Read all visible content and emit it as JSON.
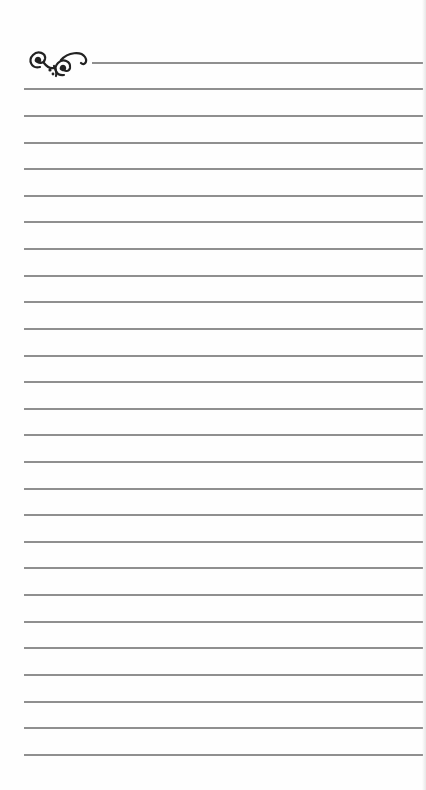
{
  "page": {
    "type": "lined-notepaper",
    "ornament": "flourish-scroll-icon",
    "line_color": "#8f8f8f",
    "background": "#fefefe",
    "line_count": 27,
    "lines_y": [
      62,
      88,
      115,
      142,
      168,
      195,
      221,
      248,
      275,
      301,
      328,
      355,
      381,
      408,
      434,
      461,
      488,
      514,
      541,
      567,
      594,
      621,
      647,
      674,
      701,
      727,
      754
    ]
  }
}
